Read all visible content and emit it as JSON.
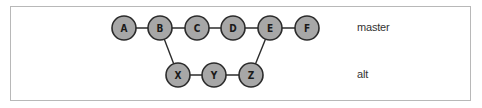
{
  "diagram": {
    "type": "git-branch-graph",
    "branches": [
      {
        "name": "master",
        "label": "master",
        "commits": [
          "A",
          "B",
          "C",
          "D",
          "E",
          "F"
        ]
      },
      {
        "name": "alt",
        "label": "alt",
        "commits": [
          "X",
          "Y",
          "Z"
        ]
      }
    ],
    "nodes": [
      {
        "id": "A",
        "label": "A",
        "x": 124,
        "y": 28
      },
      {
        "id": "B",
        "label": "B",
        "x": 160,
        "y": 28
      },
      {
        "id": "C",
        "label": "C",
        "x": 197,
        "y": 28
      },
      {
        "id": "D",
        "label": "D",
        "x": 233,
        "y": 28
      },
      {
        "id": "E",
        "label": "E",
        "x": 270,
        "y": 28
      },
      {
        "id": "F",
        "label": "F",
        "x": 307,
        "y": 28
      },
      {
        "id": "X",
        "label": "X",
        "x": 178,
        "y": 75
      },
      {
        "id": "Y",
        "label": "Y",
        "x": 214,
        "y": 75
      },
      {
        "id": "Z",
        "label": "Z",
        "x": 251,
        "y": 75
      }
    ],
    "edges": [
      [
        "A",
        "B"
      ],
      [
        "B",
        "C"
      ],
      [
        "C",
        "D"
      ],
      [
        "D",
        "E"
      ],
      [
        "E",
        "F"
      ],
      [
        "B",
        "X"
      ],
      [
        "X",
        "Y"
      ],
      [
        "Y",
        "Z"
      ],
      [
        "Z",
        "E"
      ]
    ],
    "colors": {
      "node_fill": "#a7a7a7",
      "node_stroke": "#2b2b2b",
      "edge": "#2b2b2b",
      "frame_border": "#b8b8b8",
      "text": "#333333"
    }
  }
}
